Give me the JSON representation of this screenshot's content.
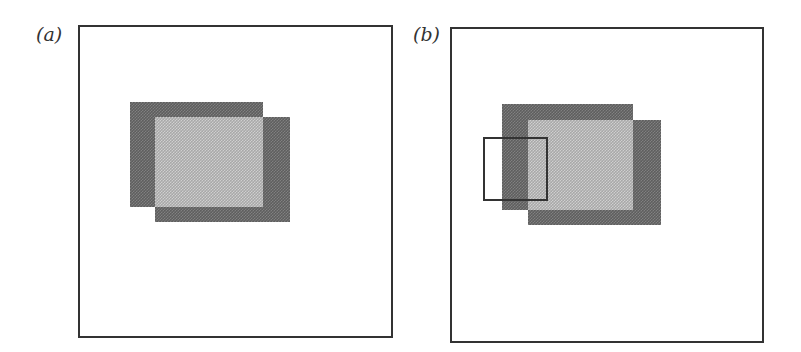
{
  "panels": [
    {
      "id": "a",
      "label": "(a)",
      "description": "Two overlapping squares inside a frame; overlap region shown lighter",
      "has_selection_box": false
    },
    {
      "id": "b",
      "label": "(b)",
      "description": "Same overlapping squares with an outlined rectangle straddling the left edge",
      "has_selection_box": true
    }
  ],
  "colors": {
    "frame": "#333333",
    "dark_fill": "#6a6a6a",
    "light_fill": "#b8b8b8",
    "background": "#ffffff"
  }
}
